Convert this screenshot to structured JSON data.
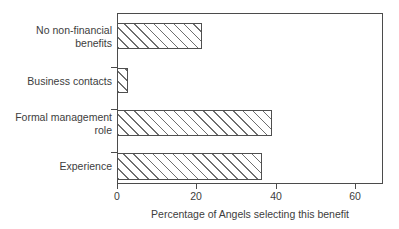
{
  "chart_data": {
    "type": "bar",
    "orientation": "horizontal",
    "title": "",
    "subtitle": "",
    "xlabel": "Percentage of Angels selecting this benefit",
    "ylabel": "",
    "categories": [
      "Experience",
      "Formal management\nrole",
      "Business contacts",
      "No non-financial\nbenefits"
    ],
    "values": [
      36.5,
      39.0,
      2.8,
      21.5
    ],
    "series": [
      {
        "name": "Percentage of Angels selecting this benefit",
        "values": [
          36.5,
          39.0,
          2.8,
          21.5
        ]
      }
    ],
    "xlim": [
      0,
      67
    ],
    "xticks": [
      0,
      20,
      40,
      60
    ],
    "xtick_labels": [
      "0",
      "20",
      "40",
      "60"
    ],
    "grid": false,
    "legend": false,
    "bar_fill": "diagonal-hatch",
    "bar_face_color": "#ffffff",
    "bar_edge_color": "#4f4f4f",
    "hatch_color": "#6e6e6e",
    "axis_color": "#4b4b4b",
    "text_color": "#3d3d3d",
    "background_color": "#ffffff"
  },
  "bars": [
    {
      "label": "No non-financial\nbenefits",
      "value": 21.5,
      "top": 10,
      "height": 26,
      "label_top": 11
    },
    {
      "label": "Business contacts",
      "value": 2.8,
      "top": 55,
      "height": 25,
      "label_top": 62
    },
    {
      "label": "Formal management\nrole",
      "value": 39.0,
      "top": 97,
      "height": 26,
      "label_top": 98
    },
    {
      "label": "Experience",
      "value": 36.5,
      "top": 140,
      "height": 27,
      "label_top": 147
    }
  ],
  "ytick_marks": [
    {
      "top": 54
    },
    {
      "top": 96
    },
    {
      "top": 139
    }
  ],
  "xticks": [
    {
      "label": "0",
      "value": 0
    },
    {
      "label": "20",
      "value": 20
    },
    {
      "label": "40",
      "value": 40
    },
    {
      "label": "60",
      "value": 60
    }
  ],
  "axis": {
    "x_title": "Percentage of Angels selecting this benefit",
    "plot_left_px": 117,
    "plot_top_px": 13,
    "plot_width_px": 266,
    "plot_height_px": 171,
    "px_per_unit": 3.97
  }
}
